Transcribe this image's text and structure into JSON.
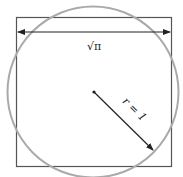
{
  "diagram": {
    "side_label": "√π",
    "radius_label": "r = 1",
    "colors": {
      "square": "#555555",
      "circle": "#aaaaaa",
      "arrow": "#222222"
    }
  }
}
